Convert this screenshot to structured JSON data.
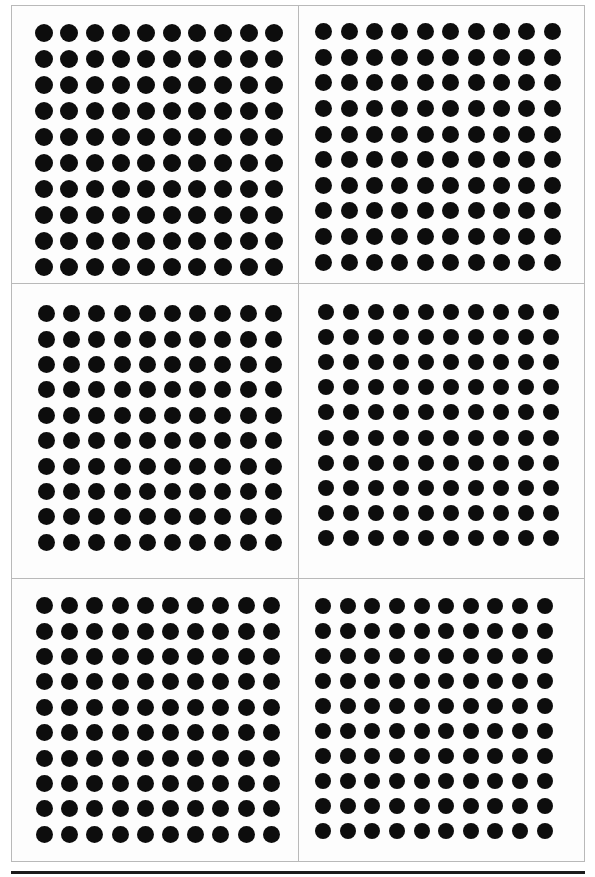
{
  "figure": {
    "panel_rows": 3,
    "panel_columns": 2,
    "total_panels": 6,
    "total_dots": 600,
    "frame_color": "#b9b9b9",
    "dot_color": "#0d0d0d",
    "background_color": "#fdfdfd",
    "bottom_rule_color": "#1b1b1b"
  },
  "panels": [
    {
      "id": "panel-top-left",
      "position": "top-left",
      "rows": 10,
      "columns": 10,
      "dot_count": 100,
      "dot_diameter_px": 18,
      "cell_width_px": 25.6,
      "cell_height_px": 26.0,
      "array_left_px": 19,
      "array_top_px": 14,
      "array_width_px": 256,
      "array_height_px": 260
    },
    {
      "id": "panel-top-right",
      "position": "top-right",
      "rows": 10,
      "columns": 10,
      "dot_count": 100,
      "dot_diameter_px": 17,
      "cell_width_px": 25.4,
      "cell_height_px": 25.6,
      "array_left_px": 12,
      "array_top_px": 13,
      "array_width_px": 254,
      "array_height_px": 256
    },
    {
      "id": "panel-middle-left",
      "position": "middle-left",
      "rows": 10,
      "columns": 10,
      "dot_count": 100,
      "dot_diameter_px": 17,
      "cell_width_px": 25.2,
      "cell_height_px": 25.4,
      "array_left_px": 22,
      "array_top_px": 17,
      "array_width_px": 252,
      "array_height_px": 254
    },
    {
      "id": "panel-middle-right",
      "position": "middle-right",
      "rows": 10,
      "columns": 10,
      "dot_count": 100,
      "dot_diameter_px": 16,
      "cell_width_px": 25.0,
      "cell_height_px": 25.2,
      "array_left_px": 14,
      "array_top_px": 15,
      "array_width_px": 250,
      "array_height_px": 252
    },
    {
      "id": "panel-bottom-left",
      "position": "bottom-left",
      "rows": 10,
      "columns": 10,
      "dot_count": 100,
      "dot_diameter_px": 17,
      "cell_width_px": 25.2,
      "cell_height_px": 25.4,
      "array_left_px": 20,
      "array_top_px": 14,
      "array_width_px": 252,
      "array_height_px": 254
    },
    {
      "id": "panel-bottom-right",
      "position": "bottom-right",
      "rows": 10,
      "columns": 10,
      "dot_count": 100,
      "dot_diameter_px": 16,
      "cell_width_px": 24.6,
      "cell_height_px": 25.0,
      "array_left_px": 12,
      "array_top_px": 14,
      "array_width_px": 246,
      "array_height_px": 250
    }
  ],
  "chart_data": {
    "type": "scatter",
    "title": "",
    "subtitle": "",
    "xlabel": "",
    "ylabel": "",
    "grid": false,
    "legend": null,
    "panel_layout": {
      "rows": 3,
      "columns": 2
    },
    "series": [
      {
        "name": "panel-top-left",
        "rows": 10,
        "columns": 10,
        "values": 100,
        "marker": "filled-circle",
        "color": "#0d0d0d"
      },
      {
        "name": "panel-top-right",
        "rows": 10,
        "columns": 10,
        "values": 100,
        "marker": "filled-circle",
        "color": "#0d0d0d"
      },
      {
        "name": "panel-middle-left",
        "rows": 10,
        "columns": 10,
        "values": 100,
        "marker": "filled-circle",
        "color": "#0d0d0d"
      },
      {
        "name": "panel-middle-right",
        "rows": 10,
        "columns": 10,
        "values": 100,
        "marker": "filled-circle",
        "color": "#0d0d0d"
      },
      {
        "name": "panel-bottom-left",
        "rows": 10,
        "columns": 10,
        "values": 100,
        "marker": "filled-circle",
        "color": "#0d0d0d"
      },
      {
        "name": "panel-bottom-right",
        "rows": 10,
        "columns": 10,
        "values": 100,
        "marker": "filled-circle",
        "color": "#0d0d0d"
      }
    ]
  }
}
